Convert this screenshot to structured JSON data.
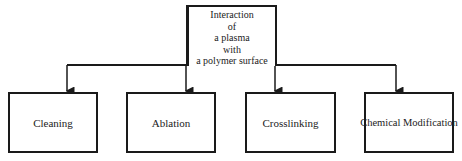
{
  "diagram": {
    "root": {
      "lines": [
        "Interaction",
        "of",
        "a plasma",
        "with",
        "a polymer surface"
      ]
    },
    "children": [
      {
        "label": "Cleaning"
      },
      {
        "label": "Ablation"
      },
      {
        "label": "Crosslinking"
      },
      {
        "label": "Chemical Modification"
      }
    ],
    "colors": {
      "line": "#1a1a1a",
      "background": "#ffffff"
    }
  }
}
